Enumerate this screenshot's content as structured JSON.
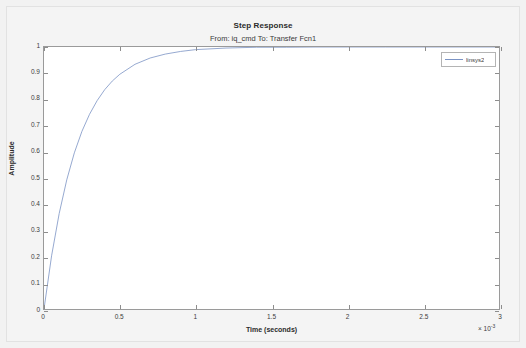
{
  "chart_data": {
    "type": "line",
    "title": "Step Response",
    "subtitle": "From: iq_cmd  To: Transfer Fcn1",
    "xlabel": "Time (seconds)",
    "ylabel": "Amplitude",
    "x_exponent_prefix": "× 10",
    "x_exponent_power": "-3",
    "xlim": [
      0,
      3
    ],
    "ylim": [
      0,
      1
    ],
    "grid": false,
    "legend_position": "top-right",
    "series": [
      {
        "name": "linsys2",
        "color": "#7b93c4",
        "x": [
          0,
          0.05,
          0.1,
          0.15,
          0.2,
          0.25,
          0.3,
          0.35,
          0.4,
          0.45,
          0.5,
          0.6,
          0.7,
          0.8,
          0.9,
          1.0,
          1.2,
          1.4,
          1.6,
          1.8,
          2.0,
          2.25,
          2.5,
          2.75,
          3.0
        ],
        "values": [
          0,
          0.203,
          0.364,
          0.493,
          0.596,
          0.678,
          0.743,
          0.795,
          0.837,
          0.87,
          0.896,
          0.934,
          0.958,
          0.973,
          0.983,
          0.99,
          0.996,
          0.999,
          0.999,
          1.0,
          1.0,
          1.0,
          1.0,
          1.0,
          1.0
        ]
      }
    ],
    "xticks": [
      {
        "value": 0,
        "label": "0"
      },
      {
        "value": 0.5,
        "label": "0.5"
      },
      {
        "value": 1,
        "label": "1"
      },
      {
        "value": 1.5,
        "label": "1.5"
      },
      {
        "value": 2,
        "label": "2"
      },
      {
        "value": 2.5,
        "label": "2.5"
      },
      {
        "value": 3,
        "label": "3"
      }
    ],
    "yticks": [
      {
        "value": 0,
        "label": "0"
      },
      {
        "value": 0.1,
        "label": "0.1"
      },
      {
        "value": 0.2,
        "label": "0.2"
      },
      {
        "value": 0.3,
        "label": "0.3"
      },
      {
        "value": 0.4,
        "label": "0.4"
      },
      {
        "value": 0.5,
        "label": "0.5"
      },
      {
        "value": 0.6,
        "label": "0.6"
      },
      {
        "value": 0.7,
        "label": "0.7"
      },
      {
        "value": 0.8,
        "label": "0.8"
      },
      {
        "value": 0.9,
        "label": "0.9"
      },
      {
        "value": 1,
        "label": "1"
      }
    ],
    "legend": [
      {
        "label": "linsys2",
        "color": "#7b93c4"
      }
    ]
  }
}
